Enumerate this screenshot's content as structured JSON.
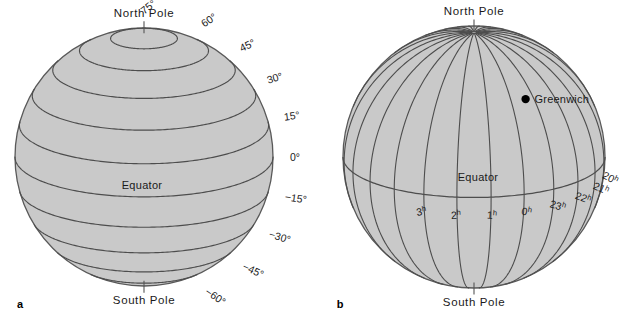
{
  "figure": {
    "background": "#ffffff",
    "sphere_fill": "#c9c9c9",
    "sphere_stroke": "#595959",
    "grid_stroke": "#4d4d4d",
    "text_color": "#1a1a1a",
    "width": 633,
    "height": 327
  },
  "panel_a": {
    "letter": "a",
    "type": "latitude-globe",
    "center": {
      "x": 144,
      "y": 157
    },
    "radius": 129,
    "tilt_deg": 18,
    "north_pole_label": "North Pole",
    "south_pole_label": "South Pole",
    "equator_label": "Equator",
    "latitude_labels": [
      {
        "text": "75°",
        "value": 75
      },
      {
        "text": "60°",
        "value": 60
      },
      {
        "text": "45°",
        "value": 45
      },
      {
        "text": "30°",
        "value": 30
      },
      {
        "text": "15°",
        "value": 15
      },
      {
        "text": "0°",
        "value": 0
      },
      {
        "text": "−15°",
        "value": -15
      },
      {
        "text": "−30°",
        "value": -30
      },
      {
        "text": "−45°",
        "value": -45
      },
      {
        "text": "−60°",
        "value": -60
      }
    ],
    "parallels_drawn": [
      75,
      60,
      45,
      30,
      15,
      0,
      -15,
      -30,
      -45,
      -60,
      -75
    ]
  },
  "panel_b": {
    "letter": "b",
    "type": "right-ascension-globe",
    "center": {
      "x": 474,
      "y": 157
    },
    "radius": 131,
    "tilt_deg": 18,
    "north_pole_label": "North Pole",
    "south_pole_label": "South Pole",
    "equator_label": "Equator",
    "marker": {
      "label": "Greenwich",
      "dot": "filled-circle"
    },
    "hour_labels": [
      {
        "num": "18",
        "sup": "h",
        "hours": 18
      },
      {
        "num": "19",
        "sup": "h",
        "hours": 19
      },
      {
        "num": "20",
        "sup": "h",
        "hours": 20
      },
      {
        "num": "21",
        "sup": "h",
        "hours": 21
      },
      {
        "num": "22",
        "sup": "h",
        "hours": 22
      },
      {
        "num": "23",
        "sup": "h",
        "hours": 23
      },
      {
        "num": "0",
        "sup": "h",
        "hours": 0
      },
      {
        "num": "1",
        "sup": "h",
        "hours": 1
      },
      {
        "num": "2",
        "sup": "h",
        "hours": 2
      },
      {
        "num": "3",
        "sup": "h",
        "hours": 3
      }
    ]
  }
}
